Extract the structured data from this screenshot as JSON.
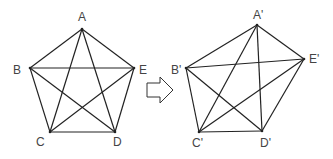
{
  "diagram": {
    "left_figure": {
      "name": "regular-pentagon-with-diagonals",
      "vertices": [
        {
          "id": "A",
          "label": "A",
          "x": 82,
          "y": 29,
          "lx": 78,
          "ly": 21
        },
        {
          "id": "B",
          "label": "B",
          "x": 30,
          "y": 68,
          "lx": 13,
          "ly": 74
        },
        {
          "id": "C",
          "label": "C",
          "x": 50,
          "y": 132,
          "lx": 36,
          "ly": 146
        },
        {
          "id": "D",
          "label": "D",
          "x": 115,
          "y": 132,
          "lx": 113,
          "ly": 146
        },
        {
          "id": "E",
          "label": "E",
          "x": 134,
          "y": 68,
          "lx": 139,
          "ly": 74
        }
      ],
      "edges": [
        [
          "A",
          "B"
        ],
        [
          "B",
          "C"
        ],
        [
          "C",
          "D"
        ],
        [
          "D",
          "E"
        ],
        [
          "E",
          "A"
        ],
        [
          "A",
          "C"
        ],
        [
          "A",
          "D"
        ],
        [
          "B",
          "D"
        ],
        [
          "B",
          "E"
        ],
        [
          "C",
          "E"
        ]
      ]
    },
    "arrow": {
      "direction": "right"
    },
    "right_figure": {
      "name": "irregular-pentagon-with-diagonals",
      "vertices": [
        {
          "id": "A'",
          "label": "A'",
          "x": 257,
          "y": 25,
          "lx": 253,
          "ly": 19
        },
        {
          "id": "B'",
          "label": "B'",
          "x": 186,
          "y": 68,
          "lx": 171,
          "ly": 74
        },
        {
          "id": "C'",
          "label": "C'",
          "x": 199,
          "y": 132,
          "lx": 192,
          "ly": 147
        },
        {
          "id": "D'",
          "label": "D'",
          "x": 262,
          "y": 131,
          "lx": 260,
          "ly": 147
        },
        {
          "id": "E'",
          "label": "E'",
          "x": 304,
          "y": 59,
          "lx": 309,
          "ly": 63
        }
      ],
      "edges": [
        [
          "A'",
          "B'"
        ],
        [
          "B'",
          "C'"
        ],
        [
          "C'",
          "D'"
        ],
        [
          "D'",
          "E'"
        ],
        [
          "E'",
          "A'"
        ],
        [
          "A'",
          "C'"
        ],
        [
          "A'",
          "D'"
        ],
        [
          "B'",
          "D'"
        ],
        [
          "B'",
          "E'"
        ],
        [
          "C'",
          "E'"
        ]
      ]
    }
  }
}
